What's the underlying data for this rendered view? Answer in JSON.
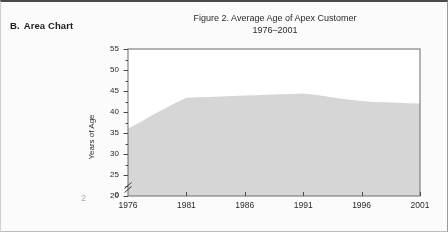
{
  "section": {
    "letter": "B.",
    "heading": "Area Chart"
  },
  "page_number": "2",
  "chart_data": {
    "type": "area",
    "title": "Figure 2.  Average Age of Apex Customer",
    "subtitle": "1976–2001",
    "xlabel": "",
    "ylabel": "Years of Age",
    "xlim": [
      1976,
      2001
    ],
    "ylim": [
      20,
      55
    ],
    "y_axis_break": true,
    "y_break_baseline_label": "0",
    "grid": false,
    "legend": null,
    "fill_color": "#d6d6d6",
    "frame_color": "#6b6b6b",
    "xticks": [
      1976,
      1981,
      1986,
      1991,
      1996,
      2001
    ],
    "xtick_labels": [
      "1976",
      "1981",
      "1986",
      "1991",
      "1996",
      "2001"
    ],
    "yticks": [
      20,
      25,
      30,
      35,
      40,
      45,
      50,
      55
    ],
    "ytick_labels": [
      "20",
      "25",
      "30",
      "35",
      "40",
      "45",
      "50",
      "55"
    ],
    "y_minor_ticks": [
      22.5,
      27.5,
      32.5,
      37.5,
      42.5,
      47.5,
      52.5
    ],
    "x": [
      1976,
      1977,
      1978,
      1979,
      1980,
      1981,
      1982,
      1983,
      1984,
      1985,
      1986,
      1987,
      1988,
      1989,
      1990,
      1991,
      1992,
      1993,
      1994,
      1995,
      1996,
      1997,
      1998,
      1999,
      2000,
      2001
    ],
    "values": [
      36.0,
      37.5,
      39.1,
      40.6,
      42.1,
      43.4,
      43.5,
      43.6,
      43.7,
      43.8,
      43.9,
      44.0,
      44.1,
      44.2,
      44.3,
      44.4,
      44.1,
      43.7,
      43.3,
      42.9,
      42.6,
      42.4,
      42.3,
      42.2,
      42.1,
      42.0
    ],
    "series": [
      {
        "name": "Average Age of Apex Customer",
        "values": [
          36.0,
          37.5,
          39.1,
          40.6,
          42.1,
          43.4,
          43.5,
          43.6,
          43.7,
          43.8,
          43.9,
          44.0,
          44.1,
          44.2,
          44.3,
          44.4,
          44.1,
          43.7,
          43.3,
          42.9,
          42.6,
          42.4,
          42.3,
          42.2,
          42.1,
          42.0
        ]
      }
    ]
  }
}
